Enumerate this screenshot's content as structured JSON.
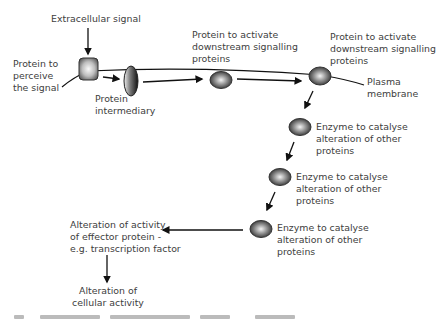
{
  "diagram": {
    "labels": {
      "extracellular_signal": "Extracellular signal",
      "receptor": [
        "Protein to",
        "perceive",
        "the signal"
      ],
      "intermediary": [
        "Protein",
        "intermediary"
      ],
      "activator_1": [
        "Protein to activate",
        "downstream signalling",
        "proteins"
      ],
      "activator_2": [
        "Protein to activate",
        "downstream signalling",
        "proteins"
      ],
      "plasma_membrane": [
        "Plasma",
        "membrane"
      ],
      "enzyme_1": [
        "Enzyme to catalyse",
        "alteration of other",
        "proteins"
      ],
      "enzyme_2": [
        "Enzyme to catalyse",
        "alteration of other",
        "proteins"
      ],
      "enzyme_3": [
        "Enzyme to catalyse",
        "alteration of other",
        "proteins"
      ],
      "effector": [
        "Alteration of activity",
        "of effector protein -",
        "e.g. transcription factor"
      ],
      "outcome": [
        "Alteration of",
        "cellular activity"
      ]
    },
    "colors": {
      "line": "#111111",
      "protein_light": "#f2f2f2",
      "protein_dark": "#3c3c3c",
      "text": "#404040"
    }
  }
}
